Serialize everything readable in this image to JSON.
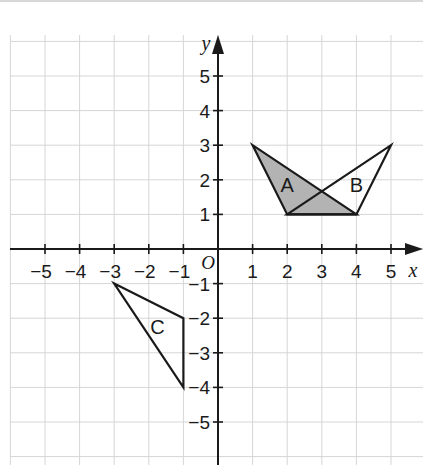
{
  "diagram": {
    "type": "coordinate-grid",
    "axes": {
      "x_label": "x",
      "y_label": "y",
      "origin_label": "O",
      "x_ticks": [
        "−5",
        "−4",
        "−3",
        "−2",
        "−1",
        "1",
        "2",
        "3",
        "4",
        "5"
      ],
      "y_ticks": [
        "5",
        "4",
        "3",
        "2",
        "1",
        "−1",
        "−2",
        "−3",
        "−4",
        "−5"
      ],
      "x_range": [
        -6,
        6
      ],
      "y_range": [
        -6,
        6
      ]
    },
    "shapes": [
      {
        "label": "A",
        "vertices": [
          [
            1,
            3
          ],
          [
            2,
            1
          ],
          [
            4,
            1
          ]
        ],
        "fill": "#b3b3b3"
      },
      {
        "label": "B",
        "vertices": [
          [
            5,
            3
          ],
          [
            4,
            1
          ],
          [
            2,
            1
          ]
        ],
        "fill": "none"
      },
      {
        "label": "C",
        "vertices": [
          [
            -3,
            -1
          ],
          [
            -1,
            -2
          ],
          [
            -1,
            -4
          ]
        ],
        "fill": "none"
      }
    ],
    "colors": {
      "grid": "#d6d6d6",
      "axis": "#1a1a1a",
      "shade": "#b3b3b3"
    }
  }
}
